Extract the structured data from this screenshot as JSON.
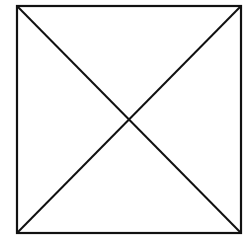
{
  "diagram": {
    "shape": "square",
    "stroke_color": "#111111",
    "background_color": "#ffffff",
    "corners": {
      "top_left": [
        17,
        6
      ],
      "top_right": [
        241,
        6
      ],
      "bottom_right": [
        241,
        233
      ],
      "bottom_left": [
        17,
        233
      ]
    },
    "diagonals": [
      {
        "from": "top_left",
        "to": "bottom_right"
      },
      {
        "from": "top_right",
        "to": "bottom_left"
      }
    ],
    "intersection": [
      129,
      119.5
    ]
  }
}
